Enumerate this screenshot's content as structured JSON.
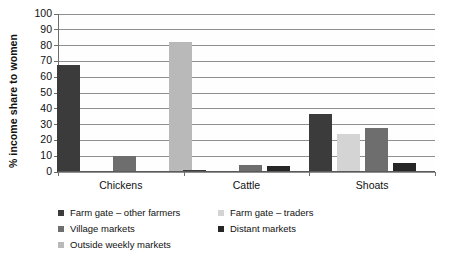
{
  "chart_data": {
    "type": "bar",
    "title": "",
    "xlabel": "",
    "ylabel": "% income share to women",
    "ylim": [
      0,
      100
    ],
    "ytick_step": 10,
    "ytick_labels": [
      "100",
      "90",
      "80",
      "70",
      "60",
      "50",
      "40",
      "30",
      "20",
      "10",
      "0"
    ],
    "grid": true,
    "legend_position": "bottom",
    "categories": [
      "Chickens",
      "Cattle",
      "Shoats"
    ],
    "series": [
      {
        "name": "Farm gate – other farmers",
        "color": "#3b3b3b",
        "values": [
          68,
          1,
          37
        ]
      },
      {
        "name": "Farm gate – traders",
        "color": "#d4d4d4",
        "values": [
          0,
          0,
          24
        ]
      },
      {
        "name": "Village markets",
        "color": "#6e6e6e",
        "values": [
          10,
          4.5,
          28
        ]
      },
      {
        "name": "Distant markets",
        "color": "#262626",
        "values": [
          0,
          3.5,
          6
        ]
      },
      {
        "name": "Outside weekly markets",
        "color": "#b9b9b9",
        "values": [
          82,
          0,
          0
        ]
      }
    ]
  },
  "axis": {
    "y_title": "% income share to women"
  },
  "legend": {
    "rows": [
      {
        "left": {
          "label": "Farm gate – other farmers",
          "color": "#3b3b3b"
        },
        "right": {
          "label": "Farm gate – traders",
          "color": "#d4d4d4"
        }
      },
      {
        "left": {
          "label": "Village markets",
          "color": "#6e6e6e"
        },
        "right": {
          "label": "Distant markets",
          "color": "#262626"
        }
      },
      {
        "left": {
          "label": "Outside weekly markets",
          "color": "#b9b9b9"
        },
        "right": null
      }
    ]
  }
}
